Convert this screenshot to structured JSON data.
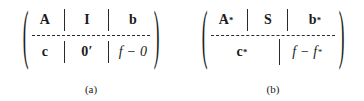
{
  "figure": {
    "type": "two-part block matrix figure",
    "panels": [
      {
        "id": "a",
        "caption": "(a)",
        "open_paren": "(",
        "close_paren": ")",
        "matrix": {
          "rows": [
            {
              "cells": [
                {
                  "text": "A",
                  "style": "bold",
                  "superscript": ""
                },
                {
                  "text": "I",
                  "style": "bold",
                  "superscript": ""
                },
                {
                  "text": "b",
                  "style": "bold",
                  "superscript": ""
                }
              ]
            },
            {
              "cells": [
                {
                  "text": "c",
                  "style": "bold",
                  "superscript": ""
                },
                {
                  "text": "0′",
                  "style": "bold",
                  "superscript": ""
                },
                {
                  "text": "f − 0",
                  "style": "italic",
                  "superscript": ""
                }
              ]
            }
          ],
          "vertical_separator": "dashed",
          "horizontal_separator": "dashed"
        }
      },
      {
        "id": "b",
        "caption": "(b)",
        "open_paren": "(",
        "close_paren": ")",
        "matrix": {
          "rows": [
            {
              "cells": [
                {
                  "text": "A",
                  "style": "bold",
                  "superscript": "*"
                },
                {
                  "text": "S",
                  "style": "bold",
                  "superscript": ""
                },
                {
                  "text": "b",
                  "style": "bold",
                  "superscript": "*"
                }
              ]
            },
            {
              "cells": [
                {
                  "text": "c",
                  "style": "bold",
                  "superscript": "*",
                  "colspan": 2
                },
                {
                  "text": "f − f",
                  "style": "italic",
                  "superscript": "*"
                }
              ]
            }
          ],
          "vertical_separator": "dashed",
          "horizontal_separator": "dashed"
        }
      }
    ],
    "colors": {
      "ink": "#1a1a1a",
      "rule": "#2b2b2b",
      "background": "#ffffff"
    }
  }
}
